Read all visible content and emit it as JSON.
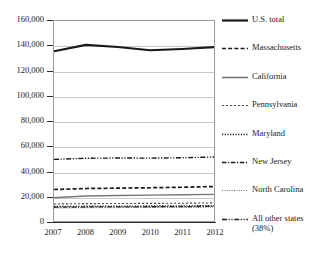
{
  "chart_data": {
    "type": "line",
    "title": "",
    "xlabel": "",
    "ylabel": "",
    "x": [
      2007,
      2008,
      2009,
      2010,
      2011,
      2012
    ],
    "xtick_labels": [
      "2007",
      "2008",
      "2009",
      "2010",
      "2011",
      "2012"
    ],
    "ytick_labels": [
      "160,000",
      "140,000",
      "120,000",
      "100,000",
      "80,000",
      "60,000",
      "40,000",
      "20,000",
      "0"
    ],
    "ytick_values": [
      160000,
      140000,
      120000,
      100000,
      80000,
      60000,
      40000,
      20000,
      0
    ],
    "ylim": [
      0,
      160000
    ],
    "xlim": [
      2007,
      2012
    ],
    "grid": true,
    "legend_position": "right",
    "series": [
      {
        "name": "U.S. total",
        "values": [
          135800,
          140900,
          139200,
          136600,
          137600,
          139100
        ],
        "style": "solid",
        "color": "#1a1a1a",
        "width": 2.2
      },
      {
        "name": "Massachusetts",
        "values": [
          25200,
          26000,
          26300,
          26600,
          27000,
          27600
        ],
        "style": "dashed",
        "color": "#1a1a1a",
        "width": 1.7
      },
      {
        "name": "California",
        "values": [
          18600,
          20000,
          20400,
          20700,
          21000,
          21300
        ],
        "style": "solid",
        "color": "#777777",
        "width": 1.3
      },
      {
        "name": "Pennsylvania",
        "values": [
          13600,
          13900,
          14000,
          14100,
          14200,
          14500
        ],
        "style": "fine-dashed",
        "color": "#4a4a4a",
        "width": 1.1
      },
      {
        "name": "Maryland",
        "values": [
          11600,
          11800,
          11900,
          12000,
          12100,
          12300
        ],
        "style": "dotted",
        "color": "#1a1a1a",
        "width": 1.3
      },
      {
        "name": "New Jersey",
        "values": [
          11000,
          11200,
          11300,
          11400,
          11500,
          11700
        ],
        "style": "dash-dot",
        "color": "#1a1a1a",
        "width": 1.3
      },
      {
        "name": "North Carolina",
        "values": [
          10400,
          10600,
          10700,
          10800,
          10900,
          11100
        ],
        "style": "fine-dotted",
        "color": "#6a6a6a",
        "width": 1.0
      },
      {
        "name": "All other states (38%)",
        "values": [
          49300,
          50200,
          50400,
          50300,
          50600,
          51200
        ],
        "style": "dash-dot-dot",
        "color": "#1a1a1a",
        "width": 1.4
      }
    ]
  },
  "legend": {
    "items": [
      {
        "label": "U.S. total",
        "style": "solid",
        "color": "#1a1a1a",
        "width": 2.2
      },
      {
        "label": "Massachusetts",
        "style": "dashed",
        "color": "#1a1a1a",
        "width": 1.7
      },
      {
        "label": "California",
        "style": "solid",
        "color": "#777777",
        "width": 1.6
      },
      {
        "label": "Pennsylvania",
        "style": "fine-dashed",
        "color": "#4a4a4a",
        "width": 1.2
      },
      {
        "label": "Maryland",
        "style": "dotted",
        "color": "#1a1a1a",
        "width": 1.4
      },
      {
        "label": "New Jersey",
        "style": "dash-dot",
        "color": "#1a1a1a",
        "width": 1.5
      },
      {
        "label": "North Carolina",
        "style": "fine-dotted",
        "color": "#6a6a6a",
        "width": 1.2
      },
      {
        "label": "All other states\n(38%)",
        "style": "dash-dot-dot",
        "color": "#1a1a1a",
        "width": 1.5
      }
    ]
  }
}
